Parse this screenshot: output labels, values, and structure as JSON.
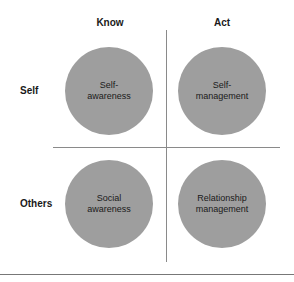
{
  "diagram": {
    "type": "2x2 quadrant",
    "columns": [
      {
        "label": "Know"
      },
      {
        "label": "Act"
      }
    ],
    "rows": [
      {
        "label": "Self"
      },
      {
        "label": "Others"
      }
    ],
    "quadrants": [
      {
        "row": "Self",
        "column": "Know",
        "label": "Self-\nawareness"
      },
      {
        "row": "Self",
        "column": "Act",
        "label": "Self-\nmanagement"
      },
      {
        "row": "Others",
        "column": "Know",
        "label": "Social\nawareness"
      },
      {
        "row": "Others",
        "column": "Act",
        "label": "Relationship\nmanagement"
      }
    ],
    "colors": {
      "circle_fill": "#9e9e9e",
      "divider": "#8a8a8a",
      "text": "#1a1a1a",
      "background": "#ffffff"
    }
  }
}
